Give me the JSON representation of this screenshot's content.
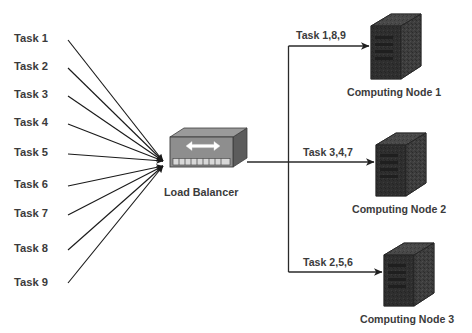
{
  "diagram": {
    "background_color": "#ffffff",
    "line_color": "#1a1a1a",
    "text_color": "#3b3b3b",
    "node_color": "#3a3a3a",
    "balancer_color": "#8a8a8a"
  },
  "tasks": [
    {
      "label": "Task 1"
    },
    {
      "label": "Task 2"
    },
    {
      "label": "Task 3"
    },
    {
      "label": "Task 4"
    },
    {
      "label": "Task 5"
    },
    {
      "label": "Task 6"
    },
    {
      "label": "Task 7"
    },
    {
      "label": "Task 8"
    },
    {
      "label": "Task 9"
    }
  ],
  "balancer": {
    "label": "Load Balancer",
    "icon": "network-switch-icon"
  },
  "flows": [
    {
      "label": "Task 1,8,9"
    },
    {
      "label": "Task 3,4,7"
    },
    {
      "label": "Task 2,5,6"
    }
  ],
  "nodes": [
    {
      "label": "Computing Node 1",
      "icon": "server-tower-icon"
    },
    {
      "label": "Computing Node 2",
      "icon": "server-tower-icon"
    },
    {
      "label": "Computing Node 3",
      "icon": "server-tower-icon"
    }
  ]
}
